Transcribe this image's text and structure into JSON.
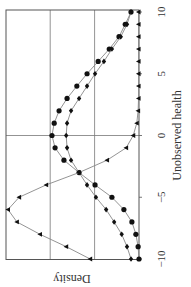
{
  "chart_data": {
    "type": "line",
    "orientation": "rotated-90-ccw",
    "title": "",
    "xlabel": "Unobserved health",
    "ylabel": "Density",
    "xlim": [
      -10,
      10
    ],
    "xticks": [
      -10,
      -5,
      0,
      5,
      10
    ],
    "xtick_labels": [
      "−10",
      "−5",
      "0",
      "5",
      "10"
    ],
    "ylim": [
      0,
      3
    ],
    "yticks_unlabeled_gridlines": [
      1,
      2
    ],
    "y_units_note": "relative density in gridline units (no tick labels shown)",
    "grid": true,
    "legend": null,
    "x": [
      -10,
      -9,
      -8,
      -7,
      -6,
      -5,
      -4,
      -3,
      -2,
      -1,
      0,
      1,
      2,
      3,
      4,
      5,
      6,
      7,
      8,
      9,
      10
    ],
    "series": [
      {
        "name": "circles",
        "marker": "circle",
        "values": [
          0.0,
          0.02,
          0.07,
          0.16,
          0.34,
          0.61,
          0.99,
          1.35,
          1.69,
          1.89,
          1.96,
          1.91,
          1.8,
          1.62,
          1.4,
          1.17,
          0.92,
          0.67,
          0.45,
          0.31,
          0.18
        ]
      },
      {
        "name": "diamonds",
        "marker": "diamond",
        "values": [
          0.18,
          0.27,
          0.39,
          0.56,
          0.74,
          0.97,
          1.17,
          1.35,
          1.53,
          1.62,
          1.64,
          1.62,
          1.53,
          1.35,
          1.17,
          0.99,
          0.79,
          0.61,
          0.41,
          0.27,
          0.18
        ]
      },
      {
        "name": "triangles",
        "marker": "triangle",
        "values": [
          1.1,
          1.64,
          2.23,
          2.75,
          2.95,
          2.7,
          2.09,
          1.35,
          0.72,
          0.29,
          0.13,
          0.05,
          0.02,
          0.01,
          0.01,
          0.01,
          0.01,
          0.01,
          0.01,
          0.01,
          0.01
        ]
      }
    ]
  },
  "labels": {
    "xlabel": "Unobserved health",
    "ylabel": "Density"
  }
}
